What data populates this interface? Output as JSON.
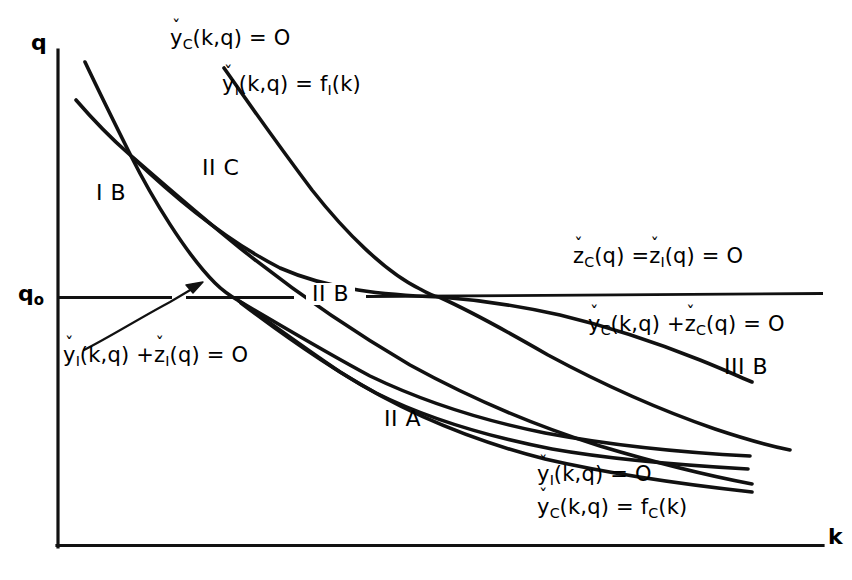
{
  "figure": {
    "type": "phase-plane-diagram",
    "background_color": "#ffffff",
    "line_color": "#000000"
  },
  "axes": {
    "y_label": "q",
    "x_label": "k",
    "y_tick_label": "q",
    "y_tick_sub": "o",
    "origin": {
      "x": 57,
      "y": 546
    },
    "x_axis_end": {
      "x": 823,
      "y": 546
    },
    "y_axis_top": {
      "x": 57,
      "y": 50
    },
    "q0_level_y": 298
  },
  "labels": {
    "top_left_eq_base": "y",
    "top_left_eq_sub": "C",
    "top_left_eq_rest": "(k,q) = O",
    "top_right_eq_base": "y",
    "top_right_eq_sub": "I",
    "top_right_eq_mid": "(k,q) = f",
    "top_right_eq_sub2": "I",
    "top_right_eq_tail": "(k)",
    "zline_eq_base1": "z",
    "zline_eq_sub1": "C",
    "zline_eq_mid": "(q) =",
    "zline_eq_base2": "z",
    "zline_eq_sub2": "I",
    "zline_eq_tail": "(q) = O",
    "yczc_base1": "y",
    "yczc_sub1": "C",
    "yczc_mid": "(k,q) +",
    "yczc_base2": "z",
    "yczc_sub2": "C",
    "yczc_tail": "(q) = O",
    "yizi_base1": "y",
    "yizi_sub1": "I",
    "yizi_mid": "(k,q) +",
    "yizi_base2": "z",
    "yizi_sub2": "I",
    "yizi_tail": "(q) = O",
    "bottom_eq1_base": "y",
    "bottom_eq1_sub": "I",
    "bottom_eq1_rest": "(k,q) = O",
    "bottom_eq2_base": "y",
    "bottom_eq2_sub": "C",
    "bottom_eq2_mid": "(k,q) = f",
    "bottom_eq2_sub2": "C",
    "bottom_eq2_tail": "(k)"
  },
  "regions": [
    {
      "id": "IB",
      "label": "I B",
      "x": 96,
      "y": 182
    },
    {
      "id": "IIC",
      "label": "II C",
      "x": 202,
      "y": 157
    },
    {
      "id": "IIB",
      "label": "II B",
      "x": 306,
      "y": 283
    },
    {
      "id": "IIA",
      "label": "II A",
      "x": 384,
      "y": 408
    },
    {
      "id": "IIIB",
      "label": "III B",
      "x": 724,
      "y": 356
    }
  ],
  "curve_descriptions": [
    {
      "name": "yC-eq-zero-curve",
      "note": "steep curve from upper-left through crossings down to lower right"
    },
    {
      "name": "yI-eq-fI-curve",
      "note": "rightmost upper curve descending to the right"
    },
    {
      "name": "yI-plus-zI-curve",
      "note": "second upper-left curve, flatter"
    },
    {
      "name": "yC-plus-zC-curve",
      "note": "curve ending near IIIB label"
    },
    {
      "name": "yI-eq-zero-curve",
      "note": "lower curve"
    },
    {
      "name": "yC-eq-fC-curve",
      "note": "lowest curve"
    },
    {
      "name": "q0-horizontal-line",
      "note": "horizontal line at q sub o, labelled zC(q)=zI(q)=O"
    }
  ]
}
